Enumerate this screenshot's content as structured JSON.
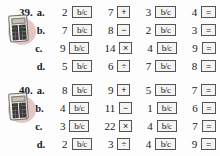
{
  "page": {
    "background_color": "#fdfdfd",
    "badge_color": "#e3c3c0"
  },
  "icons": {
    "calculator": "calculator-icon"
  },
  "keys": {
    "bc_label": "b/c",
    "equals_label": "=",
    "plus_label": "+",
    "minus_label": "−",
    "times_label": "×",
    "divide_label": "÷"
  },
  "exercises": [
    {
      "number": "39.",
      "has_calculator_icon": true,
      "rows": [
        {
          "part": "a.",
          "operand1": "2",
          "key1": "b/c",
          "operand2": "7",
          "operator": "+",
          "operand3": "3",
          "key2": "b/c",
          "operand4": "4",
          "equals": "="
        },
        {
          "part": "b.",
          "operand1": "7",
          "key1": "b/c",
          "operand2": "8",
          "operator": "−",
          "operand3": "2",
          "key2": "b/c",
          "operand4": "3",
          "equals": "="
        },
        {
          "part": "c.",
          "operand1": "9",
          "key1": "b/c",
          "operand2": "14",
          "operator": "×",
          "operand3": "4",
          "key2": "b/c",
          "operand4": "9",
          "equals": "="
        },
        {
          "part": "d.",
          "operand1": "5",
          "key1": "b/c",
          "operand2": "6",
          "operator": "÷",
          "operand3": "7",
          "key2": "b/c",
          "operand4": "8",
          "equals": "="
        }
      ]
    },
    {
      "number": "40.",
      "has_calculator_icon": true,
      "rows": [
        {
          "part": "a.",
          "operand1": "8",
          "key1": "b/c",
          "operand2": "9",
          "operator": "+",
          "operand3": "5",
          "key2": "b/c",
          "operand4": "7",
          "equals": "="
        },
        {
          "part": "b.",
          "operand1": "4",
          "key1": "b/c",
          "operand2": "11",
          "operator": "−",
          "operand3": "1",
          "key2": "b/c",
          "operand4": "6",
          "equals": "="
        },
        {
          "part": "c.",
          "operand1": "3",
          "key1": "b/c",
          "operand2": "22",
          "operator": "×",
          "operand3": "4",
          "key2": "b/c",
          "operand4": "7",
          "equals": "="
        },
        {
          "part": "d.",
          "operand1": "2",
          "key1": "b/c",
          "operand2": "3",
          "operator": "÷",
          "operand3": "4",
          "key2": "b/c",
          "operand4": "9",
          "equals": "="
        }
      ]
    }
  ]
}
